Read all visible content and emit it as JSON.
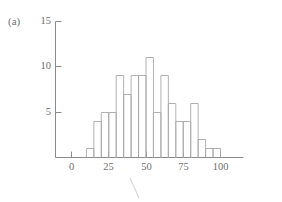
{
  "figure": {
    "panel_label": "(a)"
  },
  "chart_data": {
    "type": "bar",
    "title": "",
    "subtitle": "",
    "xlabel": "",
    "ylabel": "",
    "bin_width": 5,
    "bin_starts": [
      10,
      15,
      20,
      25,
      30,
      35,
      40,
      45,
      50,
      55,
      60,
      65,
      70,
      75,
      80,
      85,
      90,
      95
    ],
    "categories": [
      "10-15",
      "15-20",
      "20-25",
      "25-30",
      "30-35",
      "35-40",
      "40-45",
      "45-50",
      "50-55",
      "55-60",
      "60-65",
      "65-70",
      "70-75",
      "75-80",
      "80-85",
      "85-90",
      "90-95",
      "95-100"
    ],
    "values": [
      1,
      4,
      5,
      5,
      9,
      7,
      9,
      9,
      11,
      5,
      9,
      6,
      4,
      4,
      6,
      2,
      1,
      1
    ],
    "xlim": [
      -5,
      115
    ],
    "ylim": [
      0,
      15
    ],
    "xticks": [
      0,
      25,
      50,
      75,
      100
    ],
    "xtick_labels": [
      "0",
      "25",
      "50",
      "75",
      "100"
    ],
    "yticks": [
      5,
      10,
      15
    ],
    "ytick_labels": [
      "5",
      "10",
      "15"
    ],
    "grid": false,
    "legend": null,
    "bar_style": "outline",
    "bar_edge_color": "#a8a8a8",
    "axis_color": "#8a8a8a"
  }
}
